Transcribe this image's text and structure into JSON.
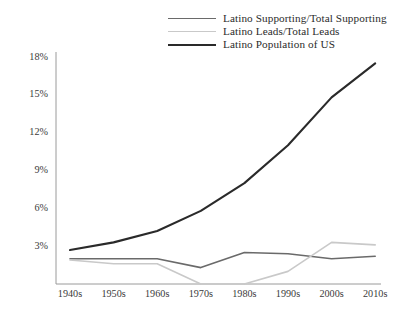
{
  "chart_data": {
    "type": "line",
    "title": "",
    "subtitle": "",
    "xlabel": "",
    "ylabel": "",
    "categories": [
      "1940s",
      "1950s",
      "1960s",
      "1970s",
      "1980s",
      "1990s",
      "2000s",
      "2010s"
    ],
    "ytick_labels": [
      "3%",
      "6%",
      "9%",
      "12%",
      "15%",
      "18%"
    ],
    "ytick_values": [
      3,
      6,
      9,
      12,
      15,
      18
    ],
    "ylim": [
      0,
      18.6
    ],
    "grid": false,
    "legend_position": "top-right",
    "value_unit": "%",
    "series": [
      {
        "name": "Latino Supporting/Total Supporting",
        "color": "#6a6a6a",
        "width": 1.6,
        "values": [
          2.0,
          2.0,
          2.0,
          1.3,
          2.5,
          2.4,
          2.0,
          2.2
        ]
      },
      {
        "name": "Latino Leads/Total Leads",
        "color": "#c9c9c9",
        "width": 1.6,
        "values": [
          1.9,
          1.6,
          1.6,
          0.0,
          0.0,
          1.0,
          3.3,
          3.1
        ]
      },
      {
        "name": "Latino Population of US",
        "color": "#2a2a2a",
        "width": 2.1,
        "values": [
          2.7,
          3.3,
          4.2,
          5.8,
          8.0,
          11.0,
          14.8,
          17.5
        ]
      }
    ]
  },
  "axes": {
    "axis_color": "#9a9a9a",
    "y_axis_name": "y-axis-line",
    "x_axis_name": "x-axis-line"
  },
  "legend": {
    "entries": [
      {
        "label": "Latino Supporting/Total Supporting",
        "color": "#6a6a6a",
        "width": 1.6
      },
      {
        "label": "Latino Leads/Total Leads",
        "color": "#c9c9c9",
        "width": 1.6
      },
      {
        "label": "Latino Population of US",
        "color": "#2a2a2a",
        "width": 2.1
      }
    ]
  }
}
